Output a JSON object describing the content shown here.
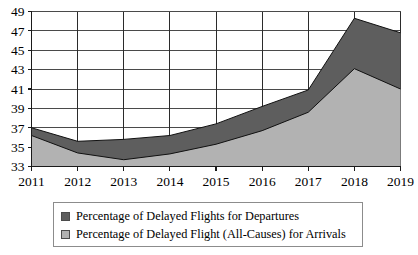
{
  "chart_data": {
    "type": "area",
    "stacked": true,
    "title": "",
    "subtitle": "",
    "xlabel": "",
    "ylabel": "",
    "categories": [
      "2011",
      "2012",
      "2013",
      "2014",
      "2015",
      "2016",
      "2017",
      "2018",
      "2019"
    ],
    "x": [
      2011,
      2012,
      2013,
      2014,
      2015,
      2016,
      2017,
      2018,
      2019
    ],
    "xlim": [
      2011,
      2019
    ],
    "ylim": [
      33,
      49
    ],
    "ytick_labels": [
      "33",
      "35",
      "37",
      "39",
      "41",
      "43",
      "45",
      "47",
      "49"
    ],
    "ytick_values": [
      33,
      35,
      37,
      39,
      41,
      43,
      45,
      47,
      49
    ],
    "ytick_step": 2,
    "xtick_labels": [
      "2011",
      "2012",
      "2013",
      "2014",
      "2015",
      "2016",
      "2017",
      "2018",
      "2019"
    ],
    "grid": true,
    "grid_horizontal": true,
    "grid_vertical": true,
    "legend_position": "bottom",
    "series": [
      {
        "name": "Percentage of Delayed Flights for Departures",
        "color": "#5e5e5e",
        "stack_order": "top",
        "values": [
          37.0,
          35.6,
          35.8,
          36.2,
          37.4,
          39.2,
          40.9,
          48.3,
          46.8
        ]
      },
      {
        "name": "Percentage of Delayed Flight (All-Causes) for Arrivals",
        "color": "#b2b2b2",
        "stack_order": "bottom",
        "values": [
          36.2,
          34.4,
          33.7,
          34.3,
          35.3,
          36.7,
          38.6,
          43.1,
          41.0
        ]
      }
    ]
  },
  "legend": {
    "items": [
      {
        "label": "Percentage of Delayed Flights for Departures",
        "color": "#5e5e5e"
      },
      {
        "label": "Percentage of Delayed Flight (All-Causes) for Arrivals",
        "color": "#b2b2b2"
      }
    ]
  },
  "colors": {
    "departures": "#5e5e5e",
    "arrivals": "#b2b2b2",
    "axis": "#1a1a1a",
    "gridline": "#4a4a4a",
    "background": "#ffffff"
  }
}
